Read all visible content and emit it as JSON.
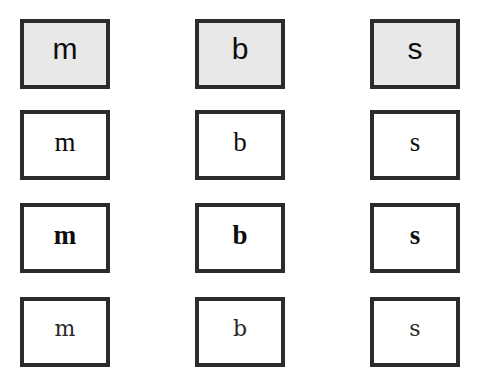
{
  "figure": {
    "name": "letter-sample-grid",
    "background_color": "#ffffff",
    "border_color": "#2b2b2b",
    "columns": [
      "m",
      "b",
      "s"
    ],
    "rows": [
      {
        "style_label": "sans-serif",
        "fill_color": "#e8e8e8",
        "filled": true,
        "bold": false,
        "cells": [
          {
            "letter": "m"
          },
          {
            "letter": "b"
          },
          {
            "letter": "s"
          }
        ]
      },
      {
        "style_label": "serif-regular",
        "fill_color": "#ffffff",
        "filled": false,
        "bold": false,
        "cells": [
          {
            "letter": "m"
          },
          {
            "letter": "b"
          },
          {
            "letter": "s"
          }
        ]
      },
      {
        "style_label": "serif-bold",
        "fill_color": "#ffffff",
        "filled": false,
        "bold": true,
        "cells": [
          {
            "letter": "m"
          },
          {
            "letter": "b"
          },
          {
            "letter": "s"
          }
        ]
      },
      {
        "style_label": "serif-light",
        "fill_color": "#ffffff",
        "filled": false,
        "bold": false,
        "cells": [
          {
            "letter": "m"
          },
          {
            "letter": "b"
          },
          {
            "letter": "s"
          }
        ]
      }
    ]
  }
}
